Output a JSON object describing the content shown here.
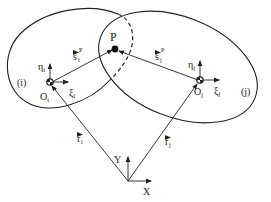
{
  "figure": {
    "bodies": [
      {
        "label": "(i)",
        "origin_label": "O",
        "origin_sub": "i",
        "xi_label": "ξ",
        "xi_sub": "i",
        "eta_label": "η",
        "eta_sub": "i"
      },
      {
        "label": "(j)",
        "origin_label": "O",
        "origin_sub": "j",
        "xi_label": "ξ",
        "xi_sub": "j",
        "eta_label": "η",
        "eta_sub": "j"
      }
    ],
    "point": {
      "label": "P"
    },
    "vectors": {
      "s_i": {
        "base": "s",
        "sub": "i",
        "sup": "P",
        "arrow": "⃗"
      },
      "s_j": {
        "base": "s",
        "sub": "j",
        "sup": "P",
        "arrow": "⃗"
      },
      "r_i": {
        "base": "r",
        "sub": "i"
      },
      "r_j": {
        "base": "r",
        "sub": "j"
      }
    },
    "global_frame": {
      "x_label": "X",
      "y_label": "Y"
    },
    "colors": {
      "line": "#222222",
      "background": "#ffffff"
    }
  }
}
